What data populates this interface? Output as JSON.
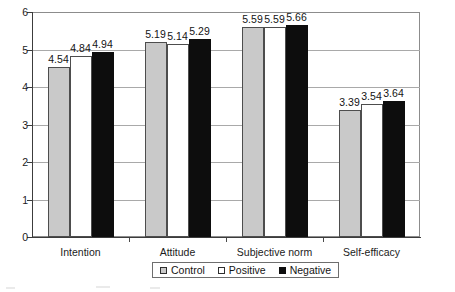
{
  "chart_data": {
    "type": "bar",
    "title": "",
    "xlabel": "",
    "ylabel": "",
    "ylim": [
      0,
      6
    ],
    "yticks": [
      0,
      1,
      2,
      3,
      4,
      5,
      6
    ],
    "ytick_labels": [
      "0",
      "1",
      "2",
      "3",
      "4",
      "5",
      "6"
    ],
    "grid": true,
    "legend_position": "bottom",
    "categories": [
      "Intention",
      "Attitude",
      "Subjective norm",
      "Self-efficacy"
    ],
    "series": [
      {
        "name": "Control",
        "color": "#c9c9c9",
        "values": [
          4.54,
          5.19,
          5.59,
          3.39
        ],
        "labels": [
          "4.54",
          "5.19",
          "5.59",
          "3.39"
        ]
      },
      {
        "name": "Positive",
        "color": "#ffffff",
        "values": [
          4.84,
          5.14,
          5.59,
          3.54
        ],
        "labels": [
          "4.84",
          "5.14",
          "5.59",
          "3.54"
        ]
      },
      {
        "name": "Negative",
        "color": "#0d0d0d",
        "values": [
          4.94,
          5.29,
          5.66,
          3.64
        ],
        "labels": [
          "4.94",
          "5.29",
          "5.66",
          "3.64"
        ]
      }
    ]
  },
  "axis": {
    "y": {
      "ticks": [
        {
          "value": 6,
          "label": "6"
        },
        {
          "value": 5,
          "label": "5"
        },
        {
          "value": 4,
          "label": "4"
        },
        {
          "value": 3,
          "label": "3"
        },
        {
          "value": 2,
          "label": "2"
        },
        {
          "value": 1,
          "label": "1"
        },
        {
          "value": 0,
          "label": "0"
        }
      ]
    },
    "x": {
      "categories": [
        {
          "label": "Intention"
        },
        {
          "label": "Attitude"
        },
        {
          "label": "Subjective norm"
        },
        {
          "label": "Self-efficacy"
        }
      ]
    }
  },
  "legend": {
    "entries": [
      {
        "label": "Control",
        "swatch": "control"
      },
      {
        "label": "Positive",
        "swatch": "positive"
      },
      {
        "label": "Negative",
        "swatch": "negative"
      }
    ]
  }
}
